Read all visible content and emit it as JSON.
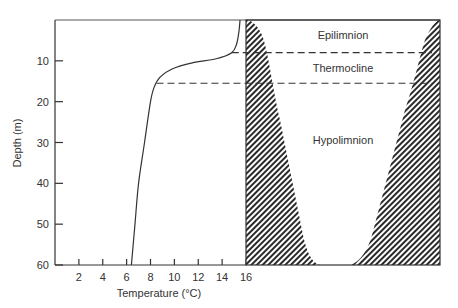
{
  "chart_data": {
    "type": "line",
    "title": "",
    "xlabel": "Temperature (°C)",
    "ylabel": "Depth (m)",
    "xlim": [
      0,
      16
    ],
    "ylim": [
      0,
      60
    ],
    "y_inverted": true,
    "x_ticks": [
      2,
      4,
      6,
      8,
      10,
      12,
      14,
      16
    ],
    "y_ticks": [
      10,
      20,
      30,
      40,
      50,
      60
    ],
    "grid": false,
    "series": [
      {
        "name": "Temperature profile",
        "points": [
          {
            "temp": 15.5,
            "depth": 0
          },
          {
            "temp": 15.4,
            "depth": 3
          },
          {
            "temp": 15.2,
            "depth": 6
          },
          {
            "temp": 14.8,
            "depth": 8
          },
          {
            "temp": 13.5,
            "depth": 9.5
          },
          {
            "temp": 11.5,
            "depth": 10.5
          },
          {
            "temp": 9.8,
            "depth": 12
          },
          {
            "temp": 8.8,
            "depth": 14
          },
          {
            "temp": 8.3,
            "depth": 16.5
          },
          {
            "temp": 8.0,
            "depth": 20
          },
          {
            "temp": 7.5,
            "depth": 30
          },
          {
            "temp": 7.0,
            "depth": 40
          },
          {
            "temp": 6.7,
            "depth": 50
          },
          {
            "temp": 6.4,
            "depth": 60
          }
        ]
      }
    ],
    "layer_boundaries": [
      {
        "name": "epilimnion-thermocline",
        "depth": 8
      },
      {
        "name": "thermocline-hypolimnion",
        "depth": 15.5
      }
    ],
    "zones": [
      {
        "label": "Epilimnion"
      },
      {
        "label": "Thermocline"
      },
      {
        "label": "Hypolimnion"
      }
    ]
  },
  "colors": {
    "line": "#333333",
    "hatch": "#2a2a2a",
    "background": "#ffffff"
  }
}
